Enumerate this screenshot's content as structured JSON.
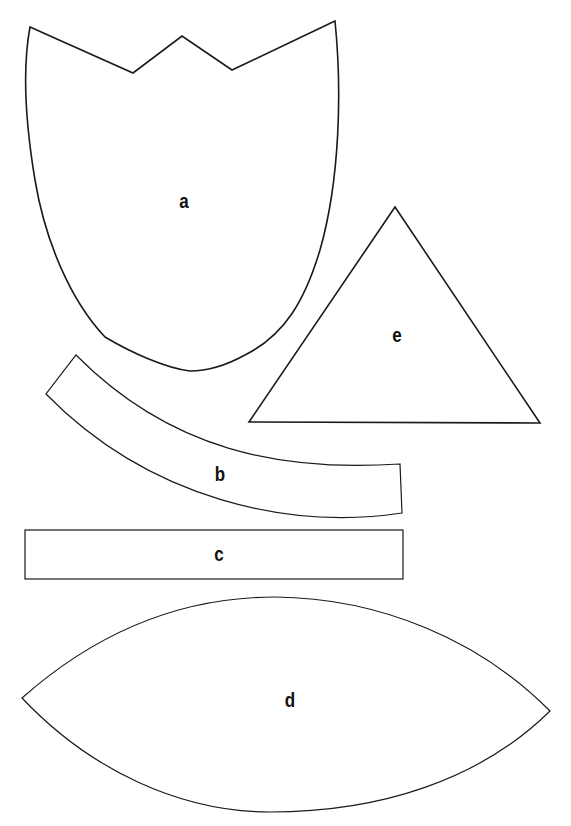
{
  "diagram": {
    "type": "paper-craft template pieces",
    "stroke_color": "#1a1a1a",
    "background": "#ffffff",
    "shapes": [
      {
        "id": "a",
        "label": "a",
        "kind": "tulip-cup (crowned top, rounded bottom)"
      },
      {
        "id": "b",
        "label": "b",
        "kind": "curved strip"
      },
      {
        "id": "c",
        "label": "c",
        "kind": "rectangle strip"
      },
      {
        "id": "d",
        "label": "d",
        "kind": "pointed oval / leaf (vesica)"
      },
      {
        "id": "e",
        "label": "e",
        "kind": "triangle"
      }
    ]
  }
}
